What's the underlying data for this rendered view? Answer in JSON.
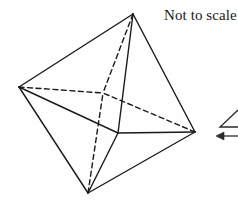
{
  "figure": {
    "kind": "geometry-diagram",
    "shape_name": "octahedron",
    "caption": "Not to scale",
    "canvas": {
      "width": 238,
      "height": 208
    },
    "colors": {
      "background": "#fefefe",
      "stroke": "#1a1a1a",
      "text": "#1a1a1a"
    },
    "stroke_width": 1.4,
    "dash_pattern": "5,3.5",
    "vertices": {
      "top": {
        "x": 133,
        "y": 14,
        "label": ""
      },
      "left": {
        "x": 19,
        "y": 87,
        "label": ""
      },
      "right": {
        "x": 195,
        "y": 132,
        "label": ""
      },
      "bottom": {
        "x": 88,
        "y": 193,
        "label": ""
      },
      "front": {
        "x": 118,
        "y": 133,
        "label": ""
      },
      "back": {
        "x": 103,
        "y": 93,
        "label": ""
      }
    },
    "solid_edges": [
      {
        "from": "top",
        "to": "left"
      },
      {
        "from": "top",
        "to": "right"
      },
      {
        "from": "top",
        "to": "front"
      },
      {
        "from": "left",
        "to": "front"
      },
      {
        "from": "left",
        "to": "bottom"
      },
      {
        "from": "right",
        "to": "front"
      },
      {
        "from": "right",
        "to": "bottom"
      },
      {
        "from": "front",
        "to": "bottom"
      }
    ],
    "hidden_edges": [
      {
        "from": "top",
        "to": "back"
      },
      {
        "from": "left",
        "to": "back"
      },
      {
        "from": "right",
        "to": "back"
      },
      {
        "from": "bottom",
        "to": "back"
      }
    ]
  },
  "margin_annotation": {
    "present": true,
    "description": "cut-off angle mark and left-pointing arrow at right edge",
    "angle_mark": {
      "x": 219,
      "y": 112,
      "width": 19,
      "height": 16
    },
    "arrow": {
      "x": 216,
      "y": 132,
      "width": 22,
      "height": 9
    }
  }
}
